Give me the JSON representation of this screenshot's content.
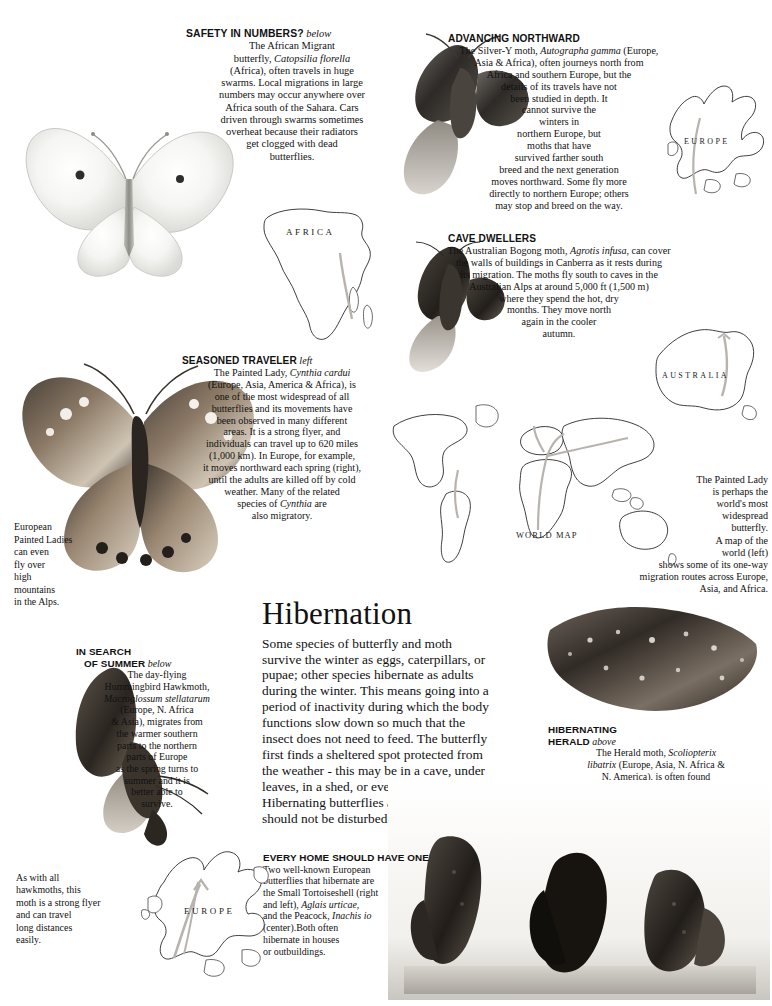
{
  "page": {
    "section_title": "Hibernation",
    "section_body": "Some species of butterfly and moth survive the winter as eggs, caterpillars, or pupae; other species hibernate as adults during the winter. This means going into a period of inactivity during which the body functions slow down so much that the insect does not need to feed. The butterfly first finds a sheltered spot protected from the weather - this may be in a cave, under leaves, in a shed, or even inside a house. Hibernating butterflies are harmless and should not be disturbed during the winter."
  },
  "callouts": {
    "safety_in_numbers": {
      "heading": "SAFETY IN NUMBERS?",
      "heading_suffix": "below",
      "body_lines": [
        "The African Migrant",
        "butterfly, <i>Catopsilia  florella</i>",
        "(Africa), often travels in huge",
        "swarms. Local migrations in large",
        "numbers may occur anywhere over",
        "Africa south of the Sahara. Cars",
        "driven through swarms sometimes",
        "overheat because their radiators",
        "get clogged with dead",
        "butterflies."
      ]
    },
    "advancing_northward": {
      "heading": "ADVANCING NORTHWARD",
      "heading_suffix": "",
      "body_lines": [
        "The Silver-Y moth, <i>Autographa  gamma</i> (Europe,",
        "Asia &amp; Africa), often journeys north from",
        "Africa and southern Europe, but the",
        "details of its travels have not",
        "been studied in depth. It",
        "cannot survive the",
        "winters in",
        "northern Europe, but",
        "moths  that  have",
        "survived  farther  south",
        "breed and the next generation",
        "moves northward. Some fly more",
        "directly to northern Europe; others",
        "may stop and breed on the way."
      ]
    },
    "cave_dwellers": {
      "heading": "CAVE DWELLERS",
      "heading_suffix": "",
      "body_lines": [
        "The Australian Bogong moth,  <i>Agrotis infusa</i>, can cover",
        "the walls of buildings in Canberra as it rests during",
        "its migration. The moths fly south to caves in the",
        "Australian Alps at around  5,000 ft (1,500 m)",
        "where they spend the hot, dry",
        "months. They move north",
        "again in the cooler",
        "autumn."
      ]
    },
    "seasoned_traveler": {
      "heading": "SEASONED TRAVELER",
      "heading_suffix": "left",
      "body_lines": [
        "The Painted Lady, <i>Cynthia  cardui</i>",
        "(Europe, Asia, America &amp; Africa), is",
        "one of the most widespread of all",
        "butterflies and its movements have",
        "been observed in many different",
        "areas. It is a strong flyer, and",
        "individuals can travel up to 620 miles",
        "(1,000 km). In Europe, for example,",
        "it moves northward each spring (right),",
        "until the adults are killed off by cold",
        "weather. Many of the related",
        "species of  <i>Cynthia</i>  are",
        "also migratory."
      ]
    },
    "european_painted_ladies": {
      "body_lines": [
        "European",
        "Painted  Ladies",
        "can even",
        "fly over",
        "high",
        "mountains",
        "in the Alps."
      ]
    },
    "painted_lady_map_note": {
      "body_lines": [
        "The Painted Lady",
        "is perhaps the",
        "world's most",
        "widespread",
        "butterfly.",
        "A map of the",
        "world  (left)",
        "shows some of  its one-way",
        "migration routes across Europe,",
        "Asia,  and  Africa."
      ]
    },
    "in_search_of_summer": {
      "heading_line1": "IN SEARCH",
      "heading_line2": "OF  SUMMER",
      "heading_suffix": "below",
      "body_lines": [
        "The  day-flying",
        "Hummingbird Hawkmoth,",
        "<i>Macroglossum  stellatarum</i>",
        "(Europe, N. Africa",
        "&amp; Asia), migrates from",
        "the warmer southern",
        "parts to the northern",
        "parts of Europe",
        "as the spring turns to",
        "summer and it is",
        "better able to",
        "survive."
      ]
    },
    "hawkmoth_note": {
      "body_lines": [
        "As  with  all",
        "hawkmoths,  this",
        "moth is a strong flyer",
        "and can travel",
        "long distances",
        "easily."
      ]
    },
    "hibernating_herald": {
      "heading_line1": "HIBERNATING",
      "heading_line2": "HERALD",
      "heading_suffix": "above",
      "body_lines": [
        "The Herald moth, <i>Scoliopterix</i>",
        "<i>libatrix</i> (Europe, Asia, N. Africa &amp;",
        "N. America), is often found",
        "hibernating in caves. As in",
        "this photograph, warm",
        "air produces beads of",
        "moisture on the",
        "wings of the",
        "insect."
      ]
    },
    "every_home": {
      "heading": "EVERY HOME SHOULD HAVE ONE",
      "body_lines": [
        "Two well-known European",
        "butterflies  that  hibernate  are",
        "the  Small  Tortoiseshell  (right",
        "and left), <i>Aglais  urticae,</i>",
        "and the Peacock, <i>Inachis io</i>",
        "(center).Both often",
        "hibernate in houses",
        "or outbuildings."
      ]
    }
  },
  "labels": {
    "map_africa": "AFRICA",
    "map_europe_top": "EUROPE",
    "map_australia": "AUSTRALIA",
    "map_world": "WORLD MAP",
    "map_europe_bottom": "EUROPE",
    "peacock": "Peacock"
  },
  "colors": {
    "ink": "#111111",
    "map_stroke": "#2a2a2a",
    "arrow": "#b9b3ad",
    "paper": "#ffffff"
  }
}
